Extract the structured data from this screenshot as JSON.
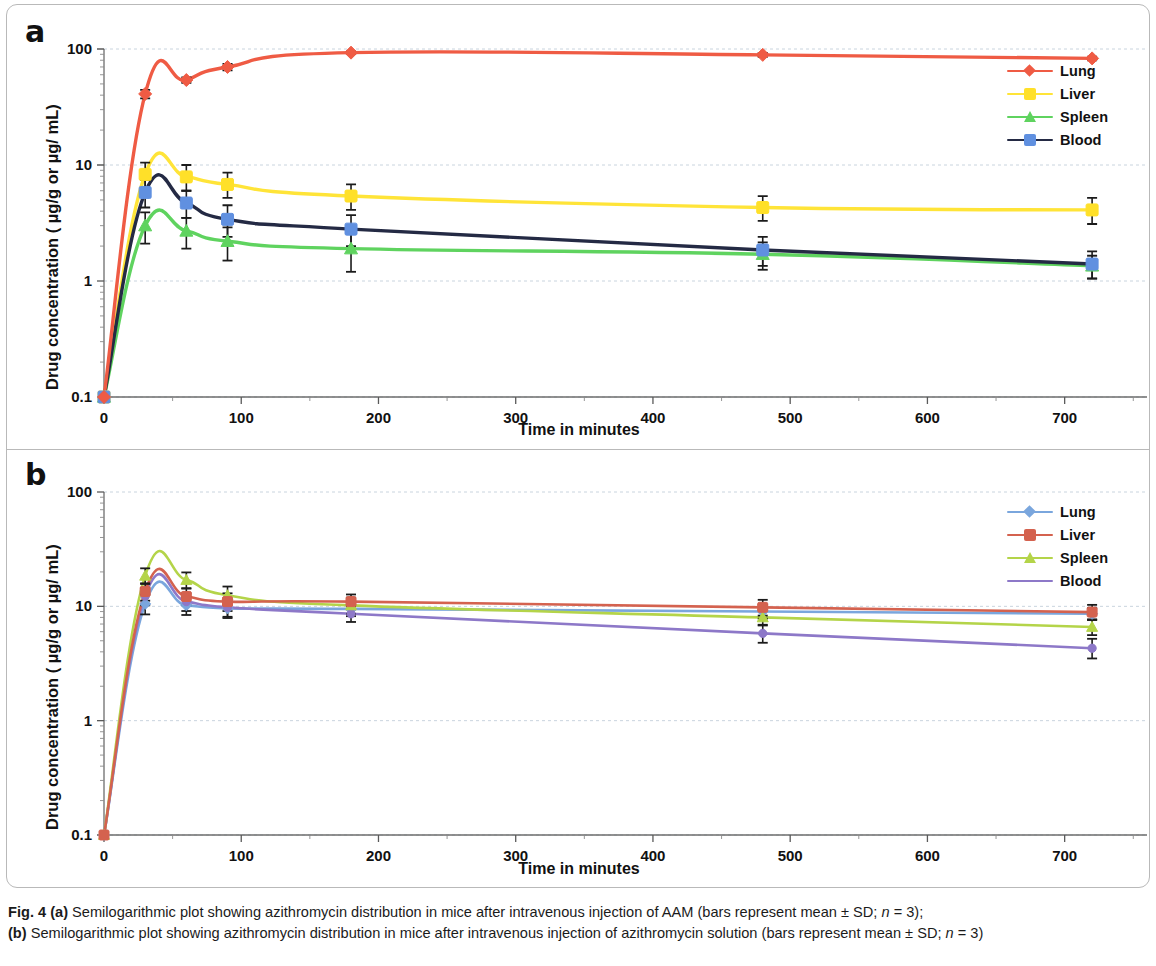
{
  "figure": {
    "caption_label": "Fig. 4",
    "caption_a_tag": "(a)",
    "caption_a_text": " Semilogarithmic plot showing azithromycin distribution in mice after intravenous injection of AAM (bars represent mean ± SD; ",
    "caption_a_n": "n",
    "caption_a_n_val": " = 3);",
    "caption_b_tag": "(b)",
    "caption_b_text": " Semilogarithmic plot showing azithromycin distribution in mice after intravenous injection of azithromycin solution (bars represent mean ± SD; ",
    "caption_b_n": "n",
    "caption_b_n_val": " = 3)"
  },
  "panel_a": {
    "letter": "a",
    "ylabel": "Drug concentration ( µg/g or µg/ mL)",
    "xlabel": "Time in minutes",
    "legend": [
      {
        "label": "Lung",
        "color": "#ef5b44",
        "marker": "diamond",
        "line": "#ef5b44"
      },
      {
        "label": "Liver",
        "color": "#ffe029",
        "marker": "square",
        "line": "#ffe438"
      },
      {
        "label": "Spleen",
        "color": "#5fd35f",
        "marker": "triangle",
        "line": "#5fd35f"
      },
      {
        "label": "Blood",
        "color": "#6090e0",
        "marker": "square",
        "line": "#242a44"
      }
    ]
  },
  "panel_b": {
    "letter": "b",
    "ylabel": "Drug concentration ( µg/g or µg/ mL)",
    "xlabel": "Time in minutes",
    "legend": [
      {
        "label": "Lung",
        "color": "#7aa6dd",
        "marker": "diamond",
        "line": "#7aa6dd"
      },
      {
        "label": "Liver",
        "color": "#d4624f",
        "marker": "square",
        "line": "#d4624f"
      },
      {
        "label": "Spleen",
        "color": "#b4d449",
        "marker": "triangle",
        "line": "#b4d449"
      },
      {
        "label": "Blood",
        "color": "#8d78c8",
        "marker": "none",
        "line": "#8d78c8"
      }
    ]
  },
  "chart_data": [
    {
      "type": "line",
      "panel": "a",
      "title": "Semilogarithmic plot showing azithromycin distribution in mice after intravenous injection of AAM",
      "xlabel": "Time in minutes",
      "ylabel": "Drug concentration (µg/g or µg/mL)",
      "yscale": "log",
      "ylim": [
        0.1,
        100
      ],
      "yticks": [
        0.1,
        1,
        10,
        100
      ],
      "ytick_labels": [
        "0.1",
        "1",
        "10",
        "100"
      ],
      "xlim": [
        0,
        760
      ],
      "xticks": [
        0,
        100,
        200,
        300,
        400,
        500,
        600,
        700
      ],
      "xtick_labels": [
        "0",
        "100",
        "200",
        "300",
        "400",
        "500",
        "600",
        "700"
      ],
      "grid": "horizontal-dashed",
      "legend_position": "upper-right",
      "x": [
        0,
        30,
        60,
        90,
        180,
        480,
        720
      ],
      "series": [
        {
          "name": "Lung",
          "values": [
            0.1,
            41,
            54,
            70,
            93,
            89,
            83
          ],
          "err_lo": [
            0,
            3.5,
            3.0,
            4.5,
            2.5,
            3.5,
            3.0
          ],
          "err_hi": [
            0,
            3.5,
            3.0,
            4.5,
            2.5,
            3.5,
            3.0
          ]
        },
        {
          "name": "Liver",
          "values": [
            0.1,
            8.3,
            7.9,
            6.8,
            5.4,
            4.3,
            4.1
          ],
          "err_lo": [
            0,
            2.0,
            1.9,
            1.6,
            1.3,
            1.0,
            1.0
          ],
          "err_hi": [
            0,
            2.2,
            2.1,
            1.8,
            1.4,
            1.1,
            1.1
          ]
        },
        {
          "name": "Spleen",
          "values": [
            0.1,
            3.0,
            2.7,
            2.2,
            1.9,
            1.7,
            1.35
          ],
          "err_lo": [
            0,
            0.9,
            0.8,
            0.7,
            0.7,
            0.45,
            0.3
          ],
          "err_hi": [
            0,
            0.9,
            0.8,
            0.7,
            0.7,
            0.45,
            0.3
          ]
        },
        {
          "name": "Blood",
          "values": [
            0.1,
            5.8,
            4.7,
            3.4,
            2.8,
            1.85,
            1.4
          ],
          "err_lo": [
            0,
            1.5,
            1.2,
            1.0,
            0.8,
            0.5,
            0.35
          ],
          "err_hi": [
            0,
            1.6,
            1.3,
            1.1,
            0.9,
            0.55,
            0.4
          ]
        }
      ]
    },
    {
      "type": "line",
      "panel": "b",
      "title": "Semilogarithmic plot showing azithromycin distribution in mice after intravenous injection of azithromycin solution",
      "xlabel": "Time in minutes",
      "ylabel": "Drug concentration (µg/g or µg/mL)",
      "yscale": "log",
      "ylim": [
        0.1,
        100
      ],
      "yticks": [
        0.1,
        1,
        10,
        100
      ],
      "ytick_labels": [
        "0.1",
        "1",
        "10",
        "100"
      ],
      "xlim": [
        0,
        760
      ],
      "xticks": [
        0,
        100,
        200,
        300,
        400,
        500,
        600,
        700
      ],
      "xtick_labels": [
        "0",
        "100",
        "200",
        "300",
        "400",
        "500",
        "600",
        "700"
      ],
      "grid": "horizontal-dashed",
      "legend_position": "upper-right",
      "x": [
        0,
        30,
        60,
        90,
        180,
        480,
        720
      ],
      "series": [
        {
          "name": "Lung",
          "values": [
            0.1,
            10.5,
            10.2,
            9.6,
            9.5,
            9.0,
            8.6
          ],
          "err_lo": [
            0,
            2.0,
            1.8,
            1.7,
            1.3,
            1.2,
            1.0
          ],
          "err_hi": [
            0,
            2.1,
            1.9,
            1.8,
            1.4,
            1.3,
            1.1
          ]
        },
        {
          "name": "Liver",
          "values": [
            0.1,
            13.5,
            12.2,
            11.0,
            11.0,
            9.8,
            8.9
          ],
          "err_lo": [
            0,
            2.3,
            2.0,
            1.9,
            1.6,
            1.5,
            1.3
          ],
          "err_hi": [
            0,
            2.4,
            2.1,
            2.0,
            1.7,
            1.6,
            1.4
          ]
        },
        {
          "name": "Spleen",
          "values": [
            0.1,
            18.5,
            17.0,
            12.5,
            10.2,
            8.0,
            6.6
          ],
          "err_lo": [
            0,
            2.8,
            2.6,
            2.2,
            1.6,
            1.2,
            1.0
          ],
          "err_hi": [
            0,
            3.0,
            2.8,
            2.4,
            1.7,
            1.3,
            1.1
          ]
        },
        {
          "name": "Blood",
          "values": [
            0.1,
            12.3,
            11.0,
            9.8,
            8.6,
            5.8,
            4.3
          ],
          "err_lo": [
            0,
            2.1,
            1.9,
            1.7,
            1.3,
            1.0,
            0.8
          ],
          "err_hi": [
            0,
            2.2,
            2.0,
            1.8,
            1.4,
            1.1,
            0.9
          ]
        }
      ]
    }
  ]
}
